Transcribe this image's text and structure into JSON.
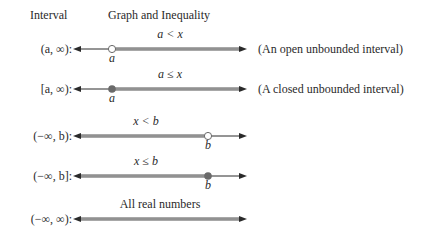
{
  "header": {
    "interval_col": "Interval",
    "graph_col": "Graph and Inequality"
  },
  "colors": {
    "axis": "#2a2a2a",
    "shade": "#9a9a9a",
    "shade_light": "#c8c8c8",
    "point_fill": "#6a6a6a",
    "point_open_fill": "#ffffff"
  },
  "rows": [
    {
      "interval": "(a, ∞):",
      "inequality": "a < x",
      "point_label": "a",
      "point_type": "open",
      "shading": "right",
      "note": "(An open unbounded interval)"
    },
    {
      "interval": "[a, ∞):",
      "inequality": "a ≤ x",
      "point_label": "a",
      "point_type": "closed",
      "shading": "right",
      "note": "(A closed unbounded interval)"
    },
    {
      "interval": "(−∞, b):",
      "inequality": "x < b",
      "point_label": "b",
      "point_type": "open",
      "shading": "left",
      "note": ""
    },
    {
      "interval": "(−∞, b]:",
      "inequality": "x ≤ b",
      "point_label": "b",
      "point_type": "closed",
      "shading": "left",
      "note": ""
    },
    {
      "interval": "(−∞, ∞):",
      "inequality": "All real numbers",
      "point_label": "",
      "point_type": "none",
      "shading": "all",
      "note": ""
    }
  ]
}
